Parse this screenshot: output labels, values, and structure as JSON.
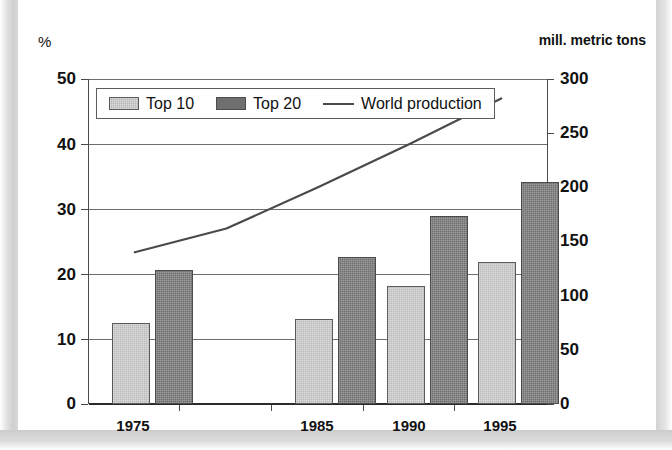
{
  "chart_data": {
    "type": "bar",
    "title": "",
    "subtitle": "",
    "xlabel": "",
    "ylabel": "%",
    "y2label": "mill. metric tons",
    "grid": true,
    "legend_position": "top-left-inside",
    "categories": [
      "1975",
      "1980",
      "1985",
      "1990",
      "1995"
    ],
    "visible_category_labels": [
      "1975",
      "1985",
      "1990",
      "1995"
    ],
    "ylim": [
      0,
      50
    ],
    "yticks": [
      0,
      10,
      20,
      30,
      40,
      50
    ],
    "y2lim": [
      0,
      300
    ],
    "y2ticks": [
      0,
      50,
      100,
      150,
      200,
      250,
      300
    ],
    "series": [
      {
        "name": "Top 10",
        "type": "bar",
        "axis": "left",
        "unit": "%",
        "color": "#dcdcdc",
        "values": [
          12.5,
          null,
          13.1,
          18.2,
          21.9
        ]
      },
      {
        "name": "Top 20",
        "type": "bar",
        "axis": "left",
        "unit": "%",
        "color": "#6f6f6f",
        "values": [
          20.6,
          null,
          22.7,
          29.0,
          34.2
        ]
      },
      {
        "name": "World production",
        "type": "line",
        "axis": "right",
        "unit": "mill. metric tons",
        "color": "#4a4a4a",
        "values": [
          140,
          162,
          200,
          240,
          282
        ]
      }
    ],
    "annotations": []
  },
  "axes": {
    "left_unit_caption": "%",
    "right_unit_caption": "mill. metric tons",
    "left_tick_labels": [
      "50",
      "40",
      "30",
      "20",
      "10",
      "0"
    ],
    "right_tick_labels": [
      "300",
      "250",
      "200",
      "150",
      "100",
      "50",
      "0"
    ],
    "x_tick_labels": [
      "1975",
      "1985",
      "1990",
      "1995"
    ]
  },
  "legend": {
    "entries": [
      {
        "label": "Top 10",
        "marker": "swatch-light-gray"
      },
      {
        "label": "Top 20",
        "marker": "swatch-dark-gray"
      },
      {
        "label": "World production",
        "marker": "line-dark-gray"
      }
    ]
  },
  "colors": {
    "top10_fill": "#dcdcdc",
    "top20_fill": "#6f6f6f",
    "line_stroke": "#4a4a4a",
    "gridline": "#6e6e6e",
    "axis": "#2b2b2b",
    "page_background": "#ffffff",
    "frame_edge": "#cfcfcf"
  }
}
